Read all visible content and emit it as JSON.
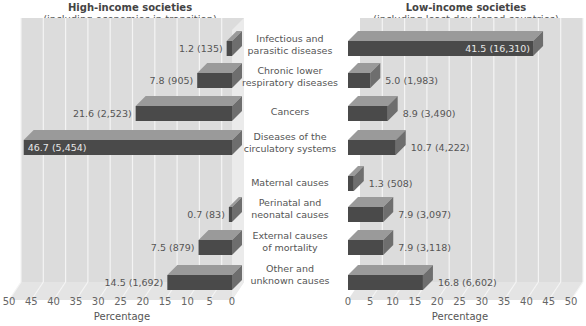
{
  "chart_data": {
    "type": "bar",
    "orientation": "horizontal",
    "style": "3d-back-to-back",
    "categories": [
      "Infectious and parasitic diseases",
      "Chronic lower respiratory diseases",
      "Cancers",
      "Diseases of the circulatory systems",
      "Maternal causes",
      "Perinatal and neonatal causes",
      "External causes of mortality",
      "Other and unknown causes"
    ],
    "series": [
      {
        "name": "High-income societies (including economies in transition)",
        "values": [
          1.2,
          7.8,
          21.6,
          46.7,
          0,
          0.7,
          7.5,
          14.5
        ],
        "counts": [
          "135",
          "905",
          "2,523",
          "5,454",
          null,
          "83",
          "879",
          "1,692"
        ],
        "labels": [
          "1.2 (135)",
          "7.8 (905)",
          "21.6 (2,523)",
          "46.7 (5,454)",
          "",
          "0.7 (83)",
          "7.5 (879)",
          "14.5 (1,692)"
        ]
      },
      {
        "name": "Low-income societies (including least developed countries)",
        "values": [
          41.5,
          5.0,
          8.9,
          10.7,
          1.3,
          7.9,
          7.9,
          16.8
        ],
        "counts": [
          "16,310",
          "1,983",
          "3,490",
          "4,222",
          "508",
          "3,097",
          "3,118",
          "6,602"
        ],
        "labels": [
          "41.5 (16,310)",
          "5.0 (1,983)",
          "8.9 (3,490)",
          "10.7 (4,222)",
          "1.3 (508)",
          "7.9 (3,097)",
          "7.9 (3,118)",
          "16.8 (6,602)"
        ]
      }
    ],
    "xlabel": "Percentage",
    "xlim": [
      0,
      50
    ],
    "xticks": [
      0,
      5,
      10,
      15,
      20,
      25,
      30,
      35,
      40,
      45,
      50
    ],
    "grid": true
  },
  "left_panel": {
    "title": "High-income societies",
    "subtitle": "(including economies in transition)",
    "xlabel": "Percentage",
    "ticks": [
      "50",
      "45",
      "40",
      "35",
      "30",
      "25",
      "20",
      "15",
      "10",
      "5",
      "0"
    ]
  },
  "right_panel": {
    "title": "Low-income societies",
    "subtitle": "(including least developed countries)",
    "xlabel": "Percentage",
    "ticks": [
      "0",
      "5",
      "10",
      "15",
      "20",
      "25",
      "30",
      "35",
      "40",
      "45",
      "50"
    ]
  },
  "categories": [
    {
      "line1": "Infectious and",
      "line2": "parasitic diseases"
    },
    {
      "line1": "Chronic lower",
      "line2": "respiratory diseases"
    },
    {
      "line1": "Cancers",
      "line2": ""
    },
    {
      "line1": "Diseases of the",
      "line2": "circulatory systems"
    },
    {
      "line1": "Maternal causes",
      "line2": ""
    },
    {
      "line1": "Perinatal and",
      "line2": "neonatal causes"
    },
    {
      "line1": "External causes",
      "line2": "of mortality"
    },
    {
      "line1": "Other and",
      "line2": "unknown causes"
    }
  ],
  "colors": {
    "wall": "#dcdcdc",
    "floor": "#e4e4e4",
    "grid": "#f4f4f4",
    "bar_front": "#4a4a4a",
    "bar_top": "#9a9a9a",
    "bar_side": "#6e6e6e",
    "text": "#555555"
  }
}
